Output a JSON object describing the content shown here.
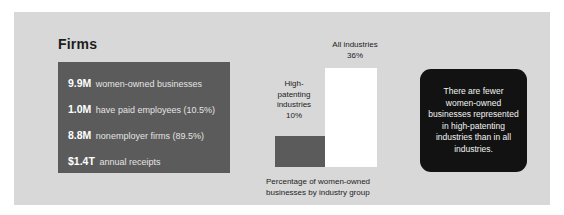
{
  "panel": {
    "background_color": "#d8d8d8",
    "title": "Firms"
  },
  "stats_box": {
    "background_color": "#5b5b5b",
    "rows": [
      {
        "value": "9.9M",
        "label": "women-owned businesses"
      },
      {
        "value": "1.0M",
        "label": "have paid employees (10.5%)"
      },
      {
        "value": "8.8M",
        "label": "nonemployer firms (89.5%)"
      },
      {
        "value": "$1.4T",
        "label": "annual receipts"
      }
    ]
  },
  "callout": {
    "background_color": "#121212",
    "text": "There are fewer women-owned businesses represented in high-patenting industries than in all industries."
  },
  "chart_data": {
    "type": "bar",
    "title": "",
    "caption": "Percentage of women-owned businesses by industry group",
    "xlabel": "",
    "ylabel": "",
    "ylim": [
      0,
      36
    ],
    "grid": false,
    "legend": "none",
    "categories": [
      "High-patenting industries",
      "All industries"
    ],
    "values": [
      10,
      36
    ],
    "value_labels": [
      "10%",
      "36%"
    ],
    "bar_colors": [
      "#5b5b5b",
      "#ffffff"
    ],
    "annotations": [
      {
        "label_lines": [
          "High-",
          "patenting",
          "industries",
          "10%"
        ],
        "for": "High-patenting industries"
      },
      {
        "label_lines": [
          "All industries",
          "36%"
        ],
        "for": "All industries"
      }
    ]
  }
}
